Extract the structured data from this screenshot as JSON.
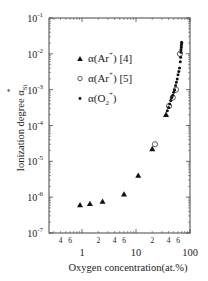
{
  "chart_data": {
    "type": "scatter",
    "title": "",
    "xlabel": "Oxygen concentration(at.%)",
    "ylabel": "Ionization degree α*Si",
    "xscale": "log",
    "yscale": "log",
    "xlim": [
      0.25,
      100
    ],
    "ylim": [
      1e-07,
      0.1
    ],
    "x_tick_labels": [
      "1",
      "10",
      "100"
    ],
    "x_minor_labels": [
      "4",
      "6",
      "2",
      "4",
      "6",
      "2",
      "4",
      "6"
    ],
    "y_tick_labels": [
      "10^-7",
      "10^-6",
      "10^-5",
      "10^-4",
      "10^-3",
      "10^-2",
      "10^-1"
    ],
    "legend_position": "upper left",
    "grid": false,
    "series": [
      {
        "name": "α(Ar*) [4]",
        "marker": "triangle",
        "x": [
          0.92,
          1.4,
          2.4,
          6.0,
          11,
          20,
          36
        ],
        "y": [
          6e-07,
          6.5e-07,
          7.5e-07,
          1.2e-06,
          4e-06,
          2.2e-05,
          0.0002
        ]
      },
      {
        "name": "α(Ar*) [5]",
        "marker": "open-circle",
        "x": [
          22.5,
          41,
          48,
          55,
          65
        ],
        "y": [
          3e-05,
          0.00035,
          0.0006,
          0.001,
          0.01
        ]
      },
      {
        "name": "α(O2*)",
        "marker": "dot",
        "x": [
          38,
          40,
          42,
          44,
          46,
          48,
          50,
          52,
          54,
          56,
          58,
          60,
          62,
          64,
          66,
          67,
          68,
          68,
          69,
          69,
          70,
          70
        ],
        "y": [
          0.00026,
          0.00032,
          0.0004,
          0.0005,
          0.0006,
          0.0007,
          0.00085,
          0.001,
          0.0013,
          0.0016,
          0.002,
          0.0026,
          0.0032,
          0.004,
          0.006,
          0.008,
          0.011,
          0.013,
          0.015,
          0.017,
          0.019,
          0.021
        ]
      }
    ]
  },
  "axes": {
    "xlabel": "Oxygen concentration(at.%)",
    "ylabel_main": "Ionization degree α",
    "ylabel_sub": "Si",
    "ylabel_sup": "*"
  },
  "legend": {
    "items": [
      {
        "label": "α(Ar",
        "sup": "+",
        "ref": ") [4]"
      },
      {
        "label": "α(Ar",
        "sup": "+",
        "ref": ") [5]"
      },
      {
        "label": "α(O",
        "sub": "2",
        "sup": "+",
        "ref": ")"
      }
    ]
  }
}
